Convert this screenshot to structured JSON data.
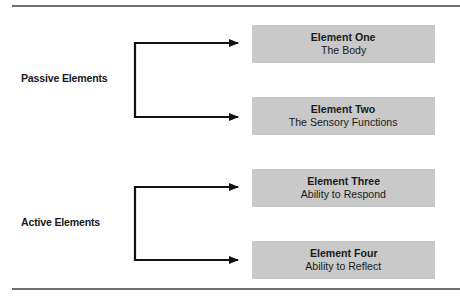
{
  "diagram": {
    "groups": [
      {
        "label": "Passive Elements",
        "elements": [
          {
            "title": "Element One",
            "subtitle": "The Body"
          },
          {
            "title": "Element Two",
            "subtitle": "The Sensory Functions"
          }
        ]
      },
      {
        "label": "Active Elements",
        "elements": [
          {
            "title": "Element Three",
            "subtitle": "Ability to Respond"
          },
          {
            "title": "Element Four",
            "subtitle": "Ability to Reflect"
          }
        ]
      }
    ],
    "colors": {
      "box_fill": "#c9c9c9",
      "connector": "#111111",
      "rule": "#6e6e6e"
    }
  }
}
